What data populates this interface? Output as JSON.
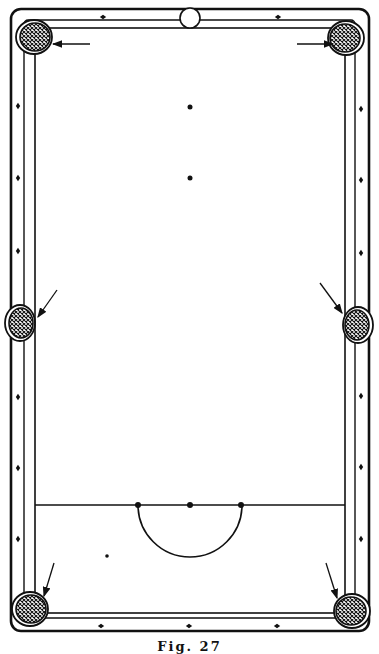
{
  "diagram": {
    "caption": "Fig. 27",
    "colors": {
      "ink": "#111111",
      "paper": "#ffffff",
      "pocket_fill": "#333333"
    },
    "table": {
      "outer": {
        "x": 11,
        "y": 9,
        "w": 358,
        "h": 622
      },
      "rail_outer": {
        "x": 18,
        "y": 16,
        "w": 343,
        "h": 606
      },
      "cushion": {
        "x": 35,
        "y": 28,
        "w": 310,
        "h": 585
      }
    },
    "diamonds": {
      "top": [
        [
          103,
          17
        ],
        [
          190,
          17
        ],
        [
          278,
          17
        ]
      ],
      "bottom": [
        [
          101,
          626
        ],
        [
          189,
          626
        ],
        [
          277,
          626
        ]
      ],
      "left": [
        [
          18,
          106
        ],
        [
          18,
          178
        ],
        [
          18,
          251
        ],
        [
          18,
          397
        ],
        [
          18,
          468
        ],
        [
          18,
          539
        ]
      ],
      "right": [
        [
          361,
          109
        ],
        [
          361,
          180
        ],
        [
          361,
          253
        ],
        [
          361,
          396
        ],
        [
          361,
          467
        ],
        [
          361,
          539
        ]
      ]
    },
    "pockets": [
      {
        "id": "top-left",
        "cx": 34,
        "cy": 37
      },
      {
        "id": "top-right",
        "cx": 346,
        "cy": 38
      },
      {
        "id": "middle-left",
        "cx": 20,
        "cy": 323
      },
      {
        "id": "middle-right",
        "cx": 358,
        "cy": 325
      },
      {
        "id": "bottom-left",
        "cx": 30,
        "cy": 609
      },
      {
        "id": "bottom-right",
        "cx": 352,
        "cy": 611
      }
    ],
    "arrows": [
      {
        "id": "arrow-top-left",
        "from": [
          90,
          44
        ],
        "to": [
          53,
          44
        ]
      },
      {
        "id": "arrow-top-right",
        "from": [
          297,
          44
        ],
        "to": [
          333,
          44
        ]
      },
      {
        "id": "arrow-middle-left",
        "from": [
          57,
          290
        ],
        "to": [
          38,
          317
        ]
      },
      {
        "id": "arrow-middle-right",
        "from": [
          320,
          283
        ],
        "to": [
          342,
          313
        ]
      },
      {
        "id": "arrow-bottom-left",
        "from": [
          54,
          563
        ],
        "to": [
          44,
          596
        ]
      },
      {
        "id": "arrow-bottom-right",
        "from": [
          326,
          563
        ],
        "to": [
          337,
          598
        ]
      }
    ],
    "white_ball": {
      "cx": 190,
      "cy": 17,
      "r": 10
    },
    "spots": [
      {
        "id": "spot-black",
        "cx": 190,
        "cy": 107,
        "r": 2.5
      },
      {
        "id": "spot-pink",
        "cx": 190,
        "cy": 178,
        "r": 2.5
      },
      {
        "id": "spot-brown",
        "cx": 190,
        "cy": 505,
        "r": 3
      },
      {
        "id": "spot-yellow",
        "cx": 138,
        "cy": 505,
        "r": 3
      },
      {
        "id": "spot-green",
        "cx": 241,
        "cy": 505,
        "r": 3
      },
      {
        "id": "cue-ball-position",
        "cx": 107,
        "cy": 556,
        "r": 1.8
      }
    ],
    "baulk_line": {
      "x1": 35,
      "x2": 345,
      "y": 505
    },
    "d_semicircle": {
      "cx": 190,
      "cy": 505,
      "r": 52
    }
  }
}
